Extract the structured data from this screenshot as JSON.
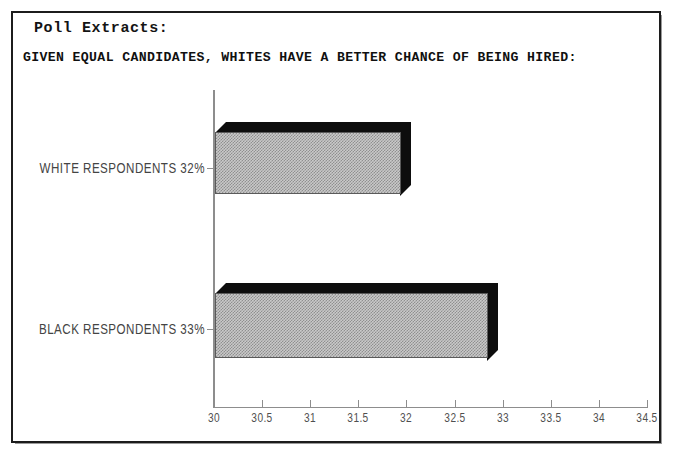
{
  "document": {
    "label": "Poll Extracts:",
    "title": "GIVEN EQUAL CANDIDATES, WHITES HAVE A BETTER CHANCE OF BEING HIRED:"
  },
  "colors": {
    "frame": "#1c1c1c",
    "bar_face": "#c9c9c9",
    "bar_shadow": "#0d0d0d",
    "axis": "#8d8d8d",
    "text": "#141414"
  },
  "chart_data": {
    "type": "bar",
    "orientation": "horizontal",
    "title": "GIVEN EQUAL CANDIDATES, WHITES HAVE A BETTER CHANCE OF BEING HIRED:",
    "xlabel": "",
    "ylabel": "",
    "categories": [
      "WHITE RESPONDENTS 32%",
      "BLACK RESPONDENTS 33%"
    ],
    "values": [
      32,
      33
    ],
    "value_labels": [
      "32%",
      "33%"
    ],
    "xlim": [
      30,
      34.5
    ],
    "xticks": [
      30,
      30.5,
      31,
      31.5,
      32,
      32.5,
      33,
      33.5,
      34,
      34.5
    ],
    "xtick_labels": [
      "30",
      "30.5",
      "31",
      "31.5",
      "32",
      "32.5",
      "33",
      "33.5",
      "34",
      "34.5"
    ],
    "grid": false,
    "legend": false,
    "style": "3d-extruded-hatched"
  }
}
